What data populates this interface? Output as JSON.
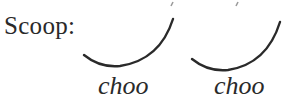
{
  "diagram": {
    "title_label": "Scoop:",
    "syllables": [
      {
        "text": "choo"
      },
      {
        "text": "choo"
      }
    ],
    "arcs": [
      {
        "name": "swing-1",
        "shape": "scoop-curve"
      },
      {
        "name": "swing-2",
        "shape": "scoop-curve"
      }
    ],
    "colors": {
      "ink": "#2a2a2a",
      "background": "#ffffff"
    }
  }
}
